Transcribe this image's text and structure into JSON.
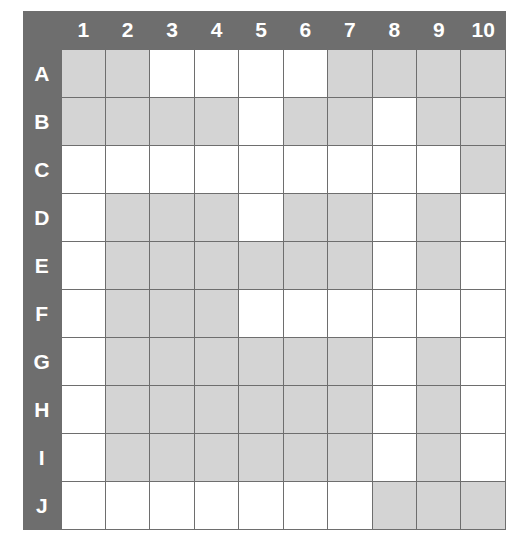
{
  "grid": {
    "title": "10x10 lettered-row numbered-column shading grid",
    "column_headers": [
      "1",
      "2",
      "3",
      "4",
      "5",
      "6",
      "7",
      "8",
      "9",
      "10"
    ],
    "row_headers": [
      "A",
      "B",
      "C",
      "D",
      "E",
      "F",
      "G",
      "H",
      "I",
      "J"
    ],
    "colors": {
      "frame": "#6e6e6e",
      "header_text": "#ffffff",
      "cell_filled": "#d4d4d4",
      "cell_empty": "#ffffff",
      "gridline": "#6e6e6e"
    },
    "legend": {
      "filled": "shaded",
      "empty": "blank"
    },
    "cells": [
      {
        "row": "A",
        "states": [
          "filled",
          "filled",
          "empty",
          "empty",
          "empty",
          "empty",
          "filled",
          "filled",
          "filled",
          "filled"
        ]
      },
      {
        "row": "B",
        "states": [
          "filled",
          "filled",
          "filled",
          "filled",
          "empty",
          "filled",
          "filled",
          "empty",
          "filled",
          "filled"
        ]
      },
      {
        "row": "C",
        "states": [
          "empty",
          "empty",
          "empty",
          "empty",
          "empty",
          "empty",
          "empty",
          "empty",
          "empty",
          "filled"
        ]
      },
      {
        "row": "D",
        "states": [
          "empty",
          "filled",
          "filled",
          "filled",
          "empty",
          "filled",
          "filled",
          "empty",
          "filled",
          "empty"
        ]
      },
      {
        "row": "E",
        "states": [
          "empty",
          "filled",
          "filled",
          "filled",
          "filled",
          "filled",
          "filled",
          "empty",
          "filled",
          "empty"
        ]
      },
      {
        "row": "F",
        "states": [
          "empty",
          "filled",
          "filled",
          "filled",
          "empty",
          "empty",
          "empty",
          "empty",
          "empty",
          "empty"
        ]
      },
      {
        "row": "G",
        "states": [
          "empty",
          "filled",
          "filled",
          "filled",
          "filled",
          "filled",
          "filled",
          "empty",
          "filled",
          "empty"
        ]
      },
      {
        "row": "H",
        "states": [
          "empty",
          "filled",
          "filled",
          "filled",
          "filled",
          "filled",
          "filled",
          "empty",
          "filled",
          "empty"
        ]
      },
      {
        "row": "I",
        "states": [
          "empty",
          "filled",
          "filled",
          "filled",
          "filled",
          "filled",
          "filled",
          "empty",
          "filled",
          "empty"
        ]
      },
      {
        "row": "J",
        "states": [
          "empty",
          "empty",
          "empty",
          "empty",
          "empty",
          "empty",
          "empty",
          "filled",
          "filled",
          "filled"
        ]
      }
    ]
  }
}
